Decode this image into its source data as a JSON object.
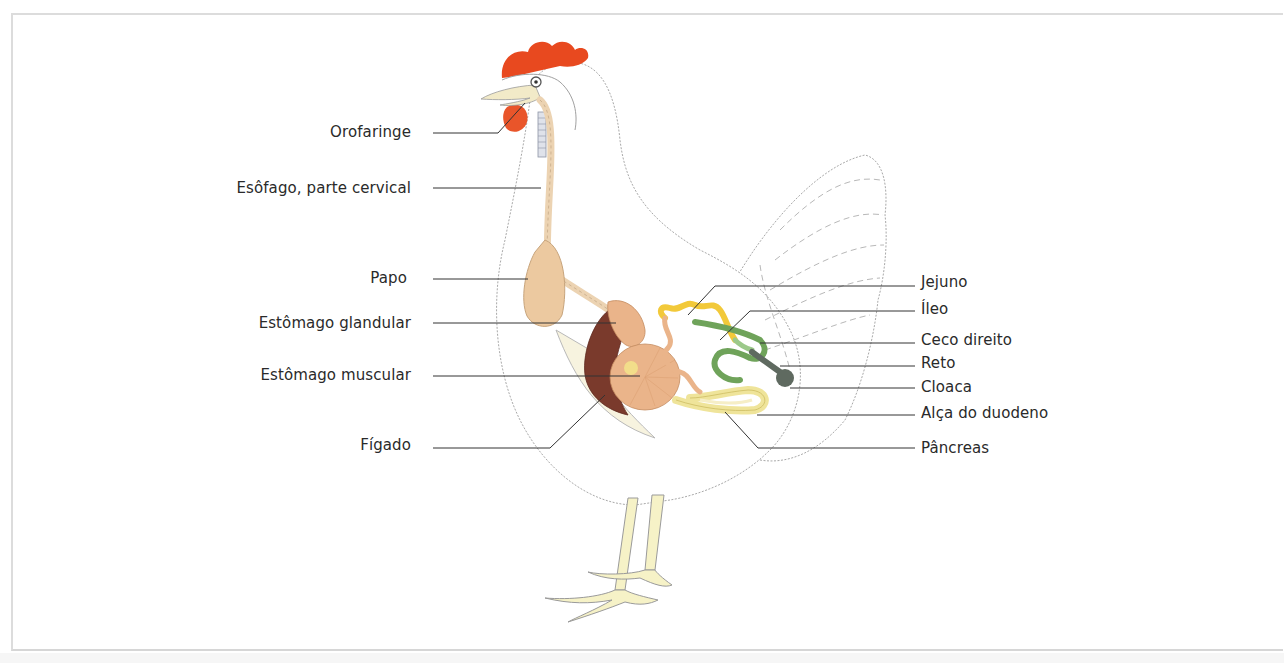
{
  "diagram": {
    "colors": {
      "comb": "#e8491f",
      "liver": "#7a3a2c",
      "crop_esophagus": "#ecc9a0",
      "stomach": "#eab48a",
      "jejunum": "#f2c93a",
      "duodenum_loop": "#efe49a",
      "ceca": "#6fa35a",
      "rectum_cloaca": "#5f6a60",
      "leader_line": "#333333"
    },
    "labels_left": [
      {
        "id": "orofaringe",
        "text": "Orofaringe"
      },
      {
        "id": "esofago",
        "text": "Esôfago, parte cervical"
      },
      {
        "id": "papo",
        "text": "Papo"
      },
      {
        "id": "estomago-glandular",
        "text": "Estômago glandular"
      },
      {
        "id": "estomago-muscular",
        "text": "Estômago muscular"
      },
      {
        "id": "figado",
        "text": "Fígado"
      }
    ],
    "labels_right": [
      {
        "id": "jejuno",
        "text": "Jejuno"
      },
      {
        "id": "ileo",
        "text": "Íleo"
      },
      {
        "id": "ceco-direito",
        "text": "Ceco direito"
      },
      {
        "id": "reto",
        "text": "Reto"
      },
      {
        "id": "cloaca",
        "text": "Cloaca"
      },
      {
        "id": "alca-duodeno",
        "text": "Alça do duodeno"
      },
      {
        "id": "pancreas",
        "text": "Pâncreas"
      }
    ]
  }
}
